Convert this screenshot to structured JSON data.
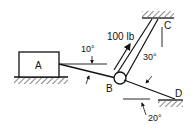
{
  "diagram": {
    "type": "statics-free-body",
    "labels": {
      "block": "A",
      "pulley": "B",
      "support_top": "C",
      "support_right": "D",
      "force": "100 lb",
      "angle_A": "10°",
      "angle_C": "30°",
      "angle_D": "20°"
    },
    "colors": {
      "stroke": "#111111",
      "background": "#ffffff"
    }
  }
}
